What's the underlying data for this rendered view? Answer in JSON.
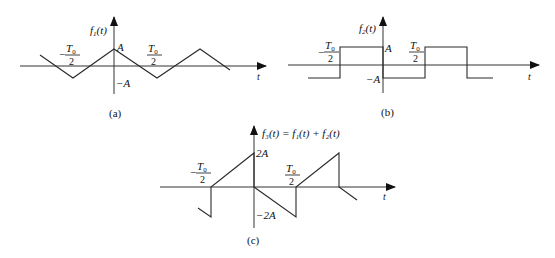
{
  "figure": {
    "panels": [
      {
        "id": "a",
        "caption": "(a)",
        "ylabel_fn": "f",
        "ylabel_sub": "1",
        "ylabel_arg": "(t)",
        "xlabel": "t",
        "level_pos": "A",
        "level_neg": "−A",
        "half_period_num": "T",
        "half_period_sub": "0",
        "half_period_den": "2",
        "minus_sign": "−",
        "waveform": "triangle",
        "points": [
          [
            40,
            55
          ],
          [
            73,
            78
          ],
          [
            114,
            49
          ],
          [
            157,
            78
          ],
          [
            200,
            49
          ],
          [
            230,
            70
          ]
        ]
      },
      {
        "id": "b",
        "caption": "(b)",
        "ylabel_fn": "f",
        "ylabel_sub": "2",
        "ylabel_arg": "(t)",
        "xlabel": "t",
        "level_pos": "A",
        "level_neg": "−A",
        "half_period_num": "T",
        "half_period_sub": "0",
        "half_period_den": "2",
        "minus_sign": "−",
        "waveform": "square",
        "points": [
          [
            308,
            78
          ],
          [
            340,
            78
          ],
          [
            340,
            47
          ],
          [
            383,
            47
          ],
          [
            383,
            78
          ],
          [
            425,
            78
          ],
          [
            425,
            47
          ],
          [
            467,
            47
          ],
          [
            467,
            78
          ],
          [
            493,
            78
          ]
        ]
      },
      {
        "id": "c",
        "caption": "(c)",
        "ylabel": "f₃(t) = f₁(t) + f₂(t)",
        "xlabel": "t",
        "level_pos": "2A",
        "level_neg": "−2A",
        "half_period_num": "T",
        "half_period_sub": "0",
        "half_period_den": "2",
        "minus_sign": "−",
        "waveform": "sawtooth-sum",
        "points": [
          [
            198,
            208
          ],
          [
            211,
            217
          ],
          [
            211,
            187
          ],
          [
            254,
            153
          ],
          [
            254,
            187
          ],
          [
            296,
            217
          ],
          [
            296,
            187
          ],
          [
            339,
            153
          ],
          [
            339,
            187
          ],
          [
            357,
            200
          ]
        ]
      }
    ]
  }
}
